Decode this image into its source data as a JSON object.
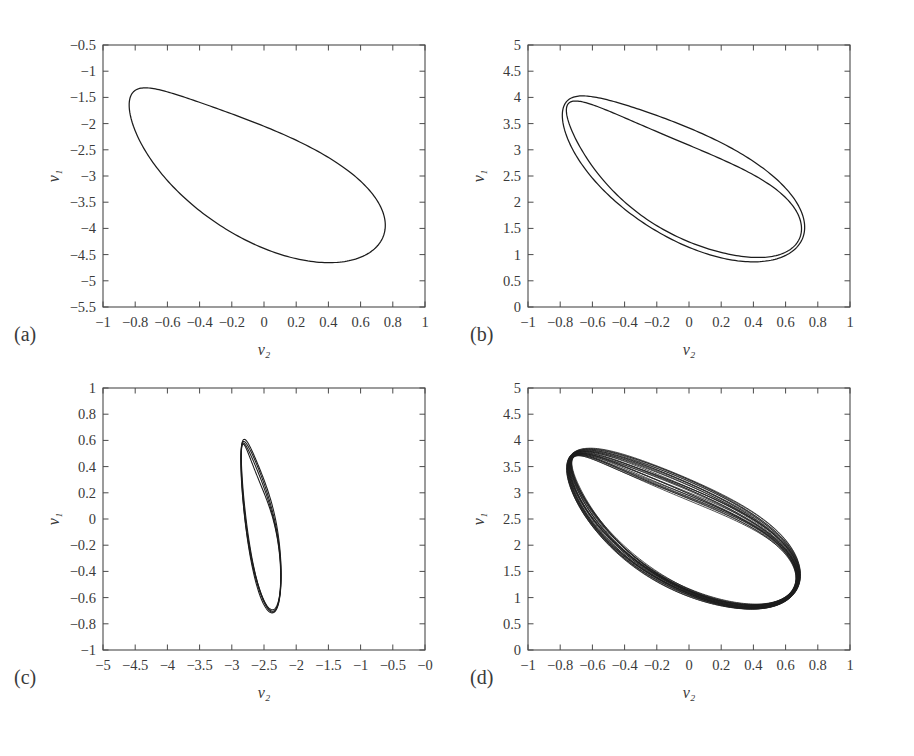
{
  "figure": {
    "title": "",
    "panel_tags": [
      "(a)",
      "(b)",
      "(c)",
      "(d)"
    ]
  },
  "chart_data": [
    {
      "type": "line",
      "panel": "(a)",
      "title": "",
      "xlabel": "ν₂",
      "ylabel": "ν₁",
      "xlim": [
        -1,
        1
      ],
      "ylim": [
        -5.5,
        -0.5
      ],
      "xticks": [
        -1,
        -0.8,
        -0.6,
        -0.4,
        -0.2,
        0,
        0.2,
        0.4,
        0.6,
        0.8,
        1
      ],
      "xticklabels": [
        "−1",
        "−0.8",
        "−0.6",
        "−0.4",
        "−0.2",
        "0",
        "0.2",
        "0.4",
        "0.6",
        "0.8",
        "1"
      ],
      "yticks": [
        -5.5,
        -5,
        -4.5,
        -4,
        -3.5,
        -3,
        -2.5,
        -2,
        -1.5,
        -1,
        -0.5
      ],
      "yticklabels": [
        "−5.5",
        "−5",
        "−4.5",
        "−4",
        "−3.5",
        "−3",
        "−2.5",
        "−2",
        "−1.5",
        "−1",
        "−0.5"
      ],
      "grid": false,
      "legend": null,
      "description": "period-1 closed limit cycle",
      "n_loops": 1,
      "orbit": {
        "center": [
          -0.05,
          -2.85
        ],
        "semi_major": 2.62,
        "semi_minor": 1.3,
        "tilt_deg": -33,
        "loop_spread": 0.0,
        "x_scale": 0.35
      }
    },
    {
      "type": "line",
      "panel": "(b)",
      "title": "",
      "xlabel": "ν₂",
      "ylabel": "ν₁",
      "xlim": [
        -1,
        1
      ],
      "ylim": [
        0,
        5
      ],
      "xticks": [
        -1,
        -0.8,
        -0.6,
        -0.4,
        -0.2,
        0,
        0.2,
        0.4,
        0.6,
        0.8,
        1
      ],
      "xticklabels": [
        "−1",
        "−0.8",
        "−0.6",
        "−0.4",
        "−0.2",
        "0",
        "0.2",
        "0.4",
        "0.6",
        "0.8",
        "1"
      ],
      "yticks": [
        0,
        0.5,
        1,
        1.5,
        2,
        2.5,
        3,
        3.5,
        4,
        4.5,
        5
      ],
      "yticklabels": [
        "0",
        "0.5",
        "1",
        "1.5",
        "2",
        "2.5",
        "3",
        "3.5",
        "4",
        "4.5",
        "5"
      ],
      "grid": false,
      "legend": null,
      "description": "period-2 orbit, two nested loops",
      "n_loops": 2,
      "orbit": {
        "center": [
          -0.04,
          2.55
        ],
        "semi_major": 2.45,
        "semi_minor": 1.15,
        "tilt_deg": -33,
        "loop_spread": 0.22,
        "x_scale": 0.35
      }
    },
    {
      "type": "line",
      "panel": "(c)",
      "title": "",
      "xlabel": "ν₂",
      "ylabel": "ν₁",
      "xlim": [
        -5,
        0
      ],
      "ylim": [
        -1,
        1
      ],
      "xticks": [
        -5,
        -4.5,
        -4,
        -3.5,
        -3,
        -2.5,
        -2,
        -1.5,
        -1,
        -0.5,
        0
      ],
      "xticklabels": [
        "−5",
        "−4.5",
        "−4",
        "−3.5",
        "−3",
        "−2.5",
        "−2",
        "−1.5",
        "−1",
        "−0.5",
        "−0"
      ],
      "yticks": [
        -1,
        -0.8,
        -0.6,
        -0.4,
        -0.2,
        0,
        0.2,
        0.4,
        0.6,
        0.8,
        1
      ],
      "yticklabels": [
        "−1",
        "−0.8",
        "−0.6",
        "−0.4",
        "−0.2",
        "0",
        "0.2",
        "0.4",
        "0.6",
        "0.8",
        "1"
      ],
      "grid": false,
      "legend": null,
      "description": "period-4 orbit, four nested loops",
      "n_loops": 4,
      "orbit": {
        "center": [
          -2.55,
          -0.01
        ],
        "semi_major": 1.02,
        "semi_minor": 0.5,
        "tilt_deg": -33,
        "loop_spread": 0.075,
        "x_scale": 0.35
      }
    },
    {
      "type": "line",
      "panel": "(d)",
      "title": "",
      "xlabel": "ν₂",
      "ylabel": "ν₁",
      "xlim": [
        -1,
        1
      ],
      "ylim": [
        0,
        5
      ],
      "xticks": [
        -1,
        -0.8,
        -0.6,
        -0.4,
        -0.2,
        0,
        0.2,
        0.4,
        0.6,
        0.8,
        1
      ],
      "xticklabels": [
        "−1",
        "−0.8",
        "−0.6",
        "−0.4",
        "−0.2",
        "0",
        "0.2",
        "0.4",
        "0.6",
        "0.8",
        "1"
      ],
      "yticks": [
        0,
        0.5,
        1,
        1.5,
        2,
        2.5,
        3,
        3.5,
        4,
        4.5,
        5
      ],
      "yticklabels": [
        "0",
        "0.5",
        "1",
        "1.5",
        "2",
        "2.5",
        "3",
        "3.5",
        "4",
        "4.5",
        "5"
      ],
      "grid": false,
      "legend": null,
      "description": "chaotic attractor, many densely overlapping loops",
      "n_loops": 26,
      "orbit": {
        "center": [
          -0.04,
          2.4
        ],
        "semi_major": 2.35,
        "semi_minor": 1.1,
        "tilt_deg": -33,
        "loop_spread": 0.3,
        "x_scale": 0.35
      }
    }
  ],
  "panels": [
    {
      "tag": "(a)",
      "x": 103,
      "y": 45,
      "w": 322,
      "h": 262,
      "tag_x": 14,
      "tag_y": 323
    },
    {
      "tag": "(b)",
      "x": 528,
      "y": 45,
      "w": 322,
      "h": 262,
      "tag_x": 470,
      "tag_y": 323
    },
    {
      "tag": "(c)",
      "x": 103,
      "y": 388,
      "w": 322,
      "h": 262,
      "tag_x": 14,
      "tag_y": 666
    },
    {
      "tag": "(d)",
      "x": 528,
      "y": 388,
      "w": 322,
      "h": 262,
      "tag_x": 470,
      "tag_y": 666
    }
  ],
  "style": {
    "axis_color": "#4a4a4a",
    "curve_color": "#1c1c1c",
    "text_color": "#3a3a3a",
    "background": "#ffffff"
  }
}
